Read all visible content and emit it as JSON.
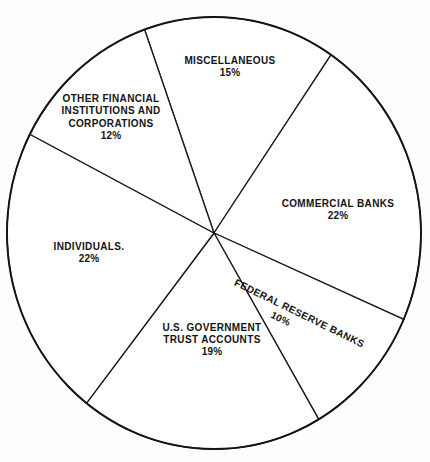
{
  "chart_data": {
    "type": "pie",
    "title": "",
    "subtitle": "",
    "xlabel": "",
    "ylabel": "",
    "legend_position": "none",
    "grid": false,
    "units": "percent",
    "total": 100,
    "categories": [
      "MISCELLANEOUS",
      "COMMERCIAL BANKS",
      "FEDERAL RESERVE BANKS",
      "U.S. GOVERNMENT TRUST ACCOUNTS",
      "INDIVIDUALS",
      "OTHER FINANCIAL INSTITUTIONS AND CORPORATIONS"
    ],
    "values": [
      15,
      22,
      10,
      19,
      22,
      12
    ],
    "slices": [
      {
        "name": "miscellaneous",
        "label": "MISCELLANEOUS",
        "label_lines": [
          "MISCELLANEOUS"
        ],
        "value": 15,
        "percent_text": "15%",
        "fill": "#ffffff",
        "stroke": "#1b1b1b"
      },
      {
        "name": "commercial-banks",
        "label": "COMMERCIAL BANKS",
        "label_lines": [
          "COMMERCIAL BANKS"
        ],
        "value": 22,
        "percent_text": "22%",
        "fill": "#ffffff",
        "stroke": "#1b1b1b"
      },
      {
        "name": "federal-reserve-banks",
        "label": "FEDERAL RESERVE BANKS",
        "label_lines": [
          "FEDERAL RESERVE BANKS"
        ],
        "value": 10,
        "percent_text": "10%",
        "fill": "#ffffff",
        "stroke": "#1b1b1b"
      },
      {
        "name": "us-government-trust-accounts",
        "label": "U.S. GOVERNMENT TRUST ACCOUNTS",
        "label_lines": [
          "U.S. GOVERNMENT",
          "TRUST ACCOUNTS"
        ],
        "value": 19,
        "percent_text": "19%",
        "fill": "#ffffff",
        "stroke": "#1b1b1b"
      },
      {
        "name": "individuals",
        "label": "INDIVIDUALS.",
        "label_lines": [
          "INDIVIDUALS."
        ],
        "value": 22,
        "percent_text": "22%",
        "fill": "#ffffff",
        "stroke": "#1b1b1b"
      },
      {
        "name": "other-financial-institutions-and-corporations",
        "label": "OTHER FINANCIAL INSTITUTIONS AND CORPORATIONS",
        "label_lines": [
          "OTHER FINANCIAL",
          "INSTITUTIONS AND",
          "CORPORATIONS"
        ],
        "value": 12,
        "percent_text": "12%",
        "fill": "#ffffff",
        "stroke": "#1b1b1b"
      }
    ],
    "geometry": {
      "center_x": 214,
      "center_y": 233,
      "radius_x": 207,
      "radius_y": 216
    },
    "colors": {
      "background": "#fdfdfc",
      "line": "#1b1b1b",
      "rim": "#141414",
      "text": "#141414"
    }
  },
  "labels": {
    "miscellaneous": {
      "line1": "MISCELLANEOUS",
      "pct": "15%"
    },
    "other_financial": {
      "line1": "OTHER FINANCIAL",
      "line2": "INSTITUTIONS AND",
      "line3": "CORPORATIONS",
      "pct": "12%"
    },
    "commercial_banks": {
      "line1": "COMMERCIAL BANKS",
      "pct": "22%"
    },
    "federal_reserve": {
      "line1": "FEDERAL RESERVE BANKS",
      "pct": "10%"
    },
    "us_government": {
      "line1": "U.S. GOVERNMENT",
      "line2": "TRUST ACCOUNTS",
      "pct": "19%"
    },
    "individuals": {
      "line1": "INDIVIDUALS.",
      "pct": "22%"
    }
  }
}
